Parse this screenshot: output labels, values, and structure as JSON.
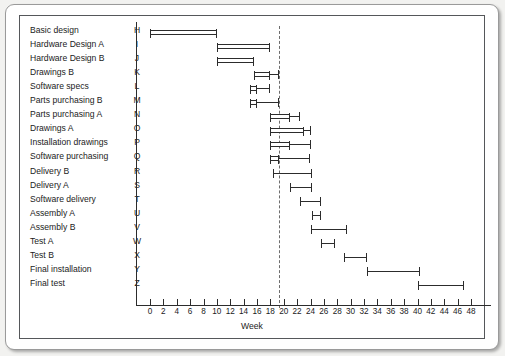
{
  "chart_data": {
    "type": "bar",
    "title": "",
    "subtitle": "",
    "xlabel": "Week",
    "ylabel": "",
    "xlim": [
      0,
      48
    ],
    "xticks": [
      0,
      2,
      4,
      6,
      8,
      10,
      12,
      14,
      16,
      18,
      20,
      22,
      24,
      26,
      28,
      30,
      32,
      34,
      36,
      38,
      40,
      42,
      44,
      46,
      48
    ],
    "grid": false,
    "legend": null,
    "orientation": "horizontal",
    "annotations": [
      {
        "name": "milestone-line",
        "style": "dashed-vertical",
        "x": 19.3,
        "label": ""
      }
    ],
    "categories": [
      "Basic design",
      "Hardware Design A",
      "Hardware Design B",
      "Drawings B",
      "Software specs",
      "Parts purchasing B",
      "Parts purchasing A",
      "Drawings A",
      "Installation drawings",
      "Software purchasing",
      "Delivery B",
      "Delivery A",
      "Software delivery",
      "Assembly A",
      "Assembly B",
      "Test A",
      "Test B",
      "Final installation",
      "Final test"
    ],
    "codes": [
      "H",
      "I",
      "J",
      "K",
      "L",
      "M",
      "N",
      "O",
      "P",
      "Q",
      "R",
      "S",
      "T",
      "U",
      "V",
      "W",
      "X",
      "Y",
      "Z"
    ],
    "tasks": [
      {
        "code": "H",
        "label": "Basic design",
        "start": 0.0,
        "end": 10.0,
        "float_end": 10.0,
        "style": "box"
      },
      {
        "code": "I",
        "label": "Hardware Design A",
        "start": 10.0,
        "end": 18.0,
        "float_end": 18.0,
        "style": "box"
      },
      {
        "code": "J",
        "label": "Hardware Design B",
        "start": 10.0,
        "end": 15.5,
        "float_end": 15.5,
        "style": "box"
      },
      {
        "code": "K",
        "label": "Drawings B",
        "start": 15.5,
        "end": 18.0,
        "float_end": 19.3,
        "style": "box"
      },
      {
        "code": "L",
        "label": "Software specs",
        "start": 15.0,
        "end": 16.0,
        "float_end": 18.0,
        "style": "box"
      },
      {
        "code": "M",
        "label": "Parts purchasing B",
        "start": 15.0,
        "end": 16.0,
        "float_end": 19.3,
        "style": "box"
      },
      {
        "code": "N",
        "label": "Parts purchasing A",
        "start": 18.0,
        "end": 21.0,
        "float_end": 22.4,
        "style": "box"
      },
      {
        "code": "O",
        "label": "Drawings A",
        "start": 18.0,
        "end": 23.0,
        "float_end": 24.0,
        "style": "box"
      },
      {
        "code": "P",
        "label": "Installation drawings",
        "start": 18.0,
        "end": 21.0,
        "float_end": 24.0,
        "style": "box"
      },
      {
        "code": "Q",
        "label": "Software purchasing",
        "start": 18.0,
        "end": 19.3,
        "float_end": 24.0,
        "style": "box"
      },
      {
        "code": "R",
        "label": "Delivery B",
        "start": 18.4,
        "end": 24.2,
        "float_end": 24.2,
        "style": "line"
      },
      {
        "code": "S",
        "label": "Delivery A",
        "start": 21.0,
        "end": 24.2,
        "float_end": 24.2,
        "style": "line"
      },
      {
        "code": "T",
        "label": "Software delivery",
        "start": 22.4,
        "end": 25.6,
        "float_end": 25.6,
        "style": "line"
      },
      {
        "code": "U",
        "label": "Assembly A",
        "start": 24.2,
        "end": 25.6,
        "float_end": 25.6,
        "style": "line"
      },
      {
        "code": "V",
        "label": "Assembly B",
        "start": 24.0,
        "end": 29.4,
        "float_end": 29.4,
        "style": "line"
      },
      {
        "code": "W",
        "label": "Test A",
        "start": 25.6,
        "end": 27.6,
        "float_end": 27.6,
        "style": "line"
      },
      {
        "code": "X",
        "label": "Test B",
        "start": 29.0,
        "end": 32.4,
        "float_end": 32.4,
        "style": "line"
      },
      {
        "code": "Y",
        "label": "Final installation",
        "start": 32.4,
        "end": 40.4,
        "float_end": 40.4,
        "style": "line"
      },
      {
        "code": "Z",
        "label": "Final test",
        "start": 40.0,
        "end": 47.0,
        "float_end": 47.0,
        "style": "line"
      }
    ]
  },
  "colors": {
    "background": "#ffffff",
    "page": "#f2f2f0",
    "ink": "#2c2c2c",
    "text": "#1b1b1b",
    "frame": "#55575a",
    "milestone": "#6d6d6d"
  }
}
